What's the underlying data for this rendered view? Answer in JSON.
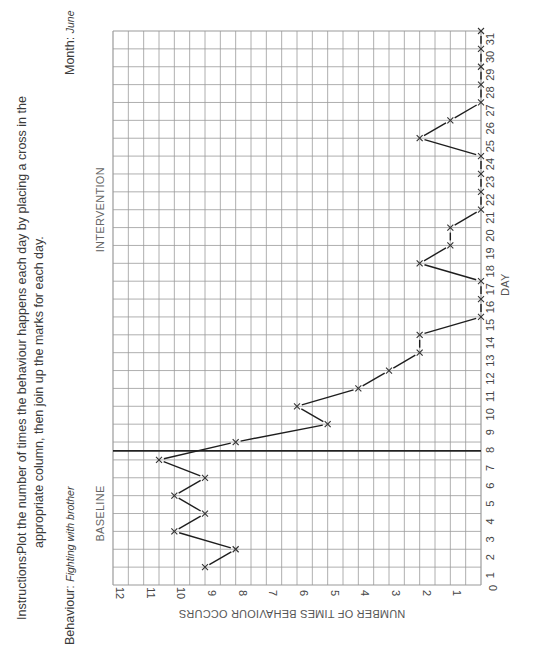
{
  "header": {
    "instructions_label": "Instructions:",
    "instructions_line1": "Plot the number of times the behaviour happens each day by placing a cross in the",
    "instructions_line2": "appropriate column, then join up the marks for each day.",
    "behaviour_label": "Behaviour:",
    "behaviour_value": "Fighting with brother",
    "month_label": "Month:",
    "month_value": "June"
  },
  "phases": {
    "baseline": "BASELINE",
    "intervention": "INTERVENTION",
    "divider_after_day": 7.5
  },
  "colors": {
    "grid": "#9a9a9a",
    "line": "#1e1e1e",
    "marker": "#333333",
    "divider": "#222222"
  },
  "chart_data": {
    "type": "line",
    "xlabel": "DAY",
    "ylabel": "NUMBER OF TIMES BEHAVIOUR OCCURS",
    "x": [
      1,
      2,
      3,
      4,
      5,
      6,
      7,
      8,
      9,
      10,
      11,
      12,
      13,
      14,
      15,
      16,
      17,
      18,
      19,
      20,
      21,
      22,
      23,
      24,
      25,
      26,
      27,
      28,
      29,
      30,
      31
    ],
    "x_ticks": [
      "1",
      "2",
      "3",
      "4",
      "5",
      "6",
      "7",
      "8",
      "9",
      "10",
      "11",
      "12",
      "13",
      "14",
      "15",
      "16",
      "17",
      "18",
      "19",
      "20",
      "21",
      "22",
      "23",
      "24",
      "25",
      "26",
      "27",
      "28",
      "29",
      "30",
      "31"
    ],
    "y_ticks": [
      "0",
      "1",
      "2",
      "3",
      "4",
      "5",
      "6",
      "7",
      "8",
      "9",
      "10",
      "11",
      "12"
    ],
    "ylim": [
      0,
      12
    ],
    "xlim": [
      0,
      31
    ],
    "grid": true,
    "series": [
      {
        "name": "Fighting with brother",
        "values": [
          9,
          8,
          10,
          9,
          10,
          9,
          10.5,
          8,
          5,
          6,
          4,
          3,
          2,
          2,
          0,
          0,
          0,
          2,
          1,
          1,
          0,
          0,
          0,
          0,
          2,
          1,
          0,
          0,
          0,
          0,
          0
        ]
      }
    ],
    "annotations": [
      {
        "text": "BASELINE",
        "range_days": [
          1,
          7
        ]
      },
      {
        "text": "INTERVENTION",
        "range_days": [
          8,
          31
        ]
      },
      {
        "type": "phase-divider",
        "between_days": [
          7,
          8
        ]
      }
    ],
    "legend": "none"
  }
}
